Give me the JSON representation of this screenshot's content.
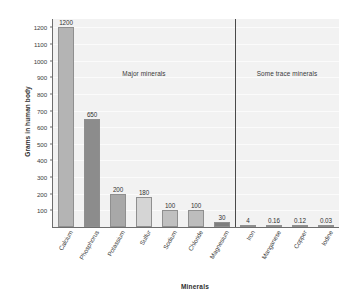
{
  "chart_data": {
    "type": "bar",
    "title": "",
    "xlabel": "Minerals",
    "ylabel": "Grams in human body",
    "categories": [
      "Calcium",
      "Phosphorus",
      "Potassium",
      "Sulfur",
      "Sodium",
      "Chloride",
      "Magnesium",
      "Iron",
      "Manganese",
      "Copper",
      "Iodine"
    ],
    "values": [
      1200,
      650,
      200,
      180,
      100,
      100,
      30,
      4,
      0.16,
      0.12,
      0.03
    ],
    "value_labels": [
      "1200",
      "650",
      "200",
      "180",
      "100",
      "100",
      "30",
      "4",
      "0.16",
      "0.12",
      "0.03"
    ],
    "bar_colors": [
      "#b4b4b4",
      "#8c8c8c",
      "#a8a8a8",
      "#d5d5d5",
      "#c0c0c0",
      "#bdbdbd",
      "#7e7e7e",
      "#9a9a9a",
      "#a0a0a0",
      "#a0a0a0",
      "#a0a0a0"
    ],
    "ylim": [
      0,
      1250
    ],
    "yticks": [
      100,
      200,
      300,
      400,
      500,
      600,
      700,
      800,
      900,
      1000,
      1100,
      1200
    ],
    "ytick_labels": [
      "100",
      "200",
      "300",
      "400",
      "500",
      "600",
      "700",
      "800",
      "900",
      "1000",
      "1100",
      "1200"
    ],
    "grid": true,
    "legend": "none",
    "annotations": [
      {
        "text": "Major minerals",
        "group": "major"
      },
      {
        "text": "Some trace minerals",
        "group": "trace"
      }
    ],
    "group_divider_after_index": 6,
    "plot_background": "#f2f2f2",
    "axis_color": "#6d6d6d",
    "divider_color": "#4a4a4a"
  }
}
